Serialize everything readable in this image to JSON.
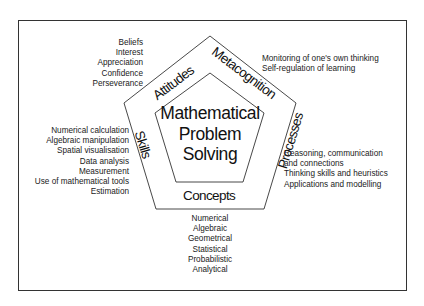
{
  "diagram": {
    "title_lines": [
      "Mathematical",
      "Problem",
      "Solving"
    ],
    "segments": {
      "attitudes": "Attitudes",
      "metacognition": "Metacognition",
      "processes": "Processes",
      "concepts": "Concepts",
      "skills": "Skills"
    },
    "attitudes_items": [
      "Beliefs",
      "Interest",
      "Appreciation",
      "Confidence",
      "Perseverance"
    ],
    "metacognition_items": [
      "Monitoring of one's own thinking",
      "Self-regulation of learning"
    ],
    "processes_items": [
      "Reasoning, communication",
      "and connections",
      "Thinking skills and heuristics",
      "Applications and modelling"
    ],
    "skills_items": [
      "Numerical calculation",
      "Algebraic manipulation",
      "Spatial visualisation",
      "Data analysis",
      "Measurement",
      "Use of mathematical tools",
      "Estimation"
    ],
    "concepts_items": [
      "Numerical",
      "Algebraic",
      "Geometrical",
      "Statistical",
      "Probabilistic",
      "Analytical"
    ],
    "colors": {
      "stroke": "#333333",
      "text": "#1a1a1a",
      "background": "#ffffff"
    }
  }
}
